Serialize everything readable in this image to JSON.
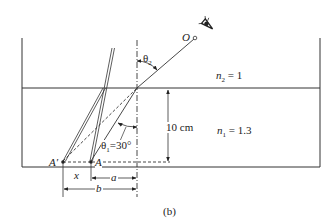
{
  "figure": {
    "caption": "(b)",
    "colors": {
      "ink": "#222222",
      "background": "#ffffff"
    }
  },
  "labels": {
    "observer": "O",
    "theta2": "θ",
    "theta2_sub": "2",
    "n2_var": "n",
    "n2_sub": "2",
    "n2_value": "= 1",
    "n1_var": "n",
    "n1_sub": "1",
    "n1_value": "= 1.3",
    "depth": "10 cm",
    "theta1": "θ",
    "theta1_sub": "1",
    "theta1_value": "=30°",
    "point_a_prime": "A′",
    "point_a": "A",
    "dim_x": "x",
    "dim_a": "a",
    "dim_b": "b"
  },
  "icons": {
    "eye": "eye-icon"
  }
}
